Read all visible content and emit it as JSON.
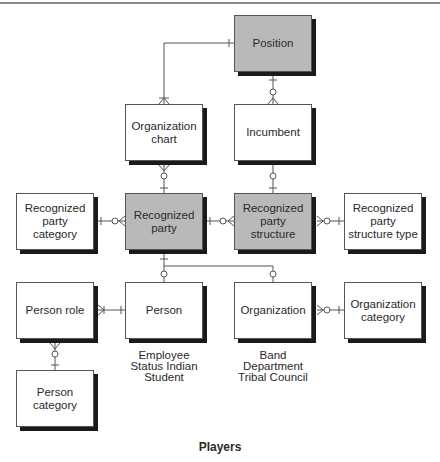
{
  "diagram": {
    "title": "Players",
    "colors": {
      "shaded_entity": "#b9b9b9",
      "plain_entity": "#ffffff",
      "shadow": "#1a1a1a",
      "line": "#555555"
    },
    "entities": {
      "position": {
        "label": "Position",
        "shaded": true
      },
      "organization_chart": {
        "label": "Organization chart",
        "shaded": false
      },
      "incumbent": {
        "label": "Incumbent",
        "shaded": false
      },
      "recognized_party_category": {
        "label": "Recognized party category",
        "shaded": false
      },
      "recognized_party": {
        "label": "Recognized party",
        "shaded": true
      },
      "recognized_party_structure": {
        "label": "Recognized party structure",
        "shaded": true
      },
      "recognized_party_structure_type": {
        "label": "Recognized party structure type",
        "shaded": false
      },
      "person_role": {
        "label": "Person role",
        "shaded": false
      },
      "person": {
        "label": "Person",
        "shaded": false
      },
      "organization": {
        "label": "Organization",
        "shaded": false
      },
      "organization_category": {
        "label": "Organization category",
        "shaded": false
      },
      "person_category": {
        "label": "Person category",
        "shaded": false
      }
    },
    "captions": {
      "person_examples": "Employee\nStatus Indian\nStudent",
      "organization_examples": "Band\nDepartment\nTribal Council"
    },
    "relationships": [
      {
        "from": "Position",
        "to": "Organization chart",
        "from_end": "one",
        "to_end": "many"
      },
      {
        "from": "Position",
        "to": "Incumbent",
        "from_end": "one",
        "to_end": "zero-or-many"
      },
      {
        "from": "Organization chart",
        "to": "Recognized party",
        "from_end": "zero-or-many",
        "to_end": "one"
      },
      {
        "from": "Incumbent",
        "to": "Recognized party structure",
        "from_end": "zero-or-one",
        "to_end": "one"
      },
      {
        "from": "Recognized party category",
        "to": "Recognized party",
        "from_end": "one",
        "to_end": "zero-or-many"
      },
      {
        "from": "Recognized party",
        "to": "Recognized party structure",
        "from_end": "one",
        "to_end": "zero-or-many"
      },
      {
        "from": "Recognized party structure",
        "to": "Recognized party structure type",
        "from_end": "zero-or-many",
        "to_end": "one"
      },
      {
        "from": "Recognized party",
        "to": "Person",
        "from_end": "one",
        "to_end": "zero-or-one"
      },
      {
        "from": "Recognized party",
        "to": "Organization",
        "from_end": "one",
        "to_end": "zero-or-one"
      },
      {
        "from": "Person role",
        "to": "Person",
        "from_end": "many",
        "to_end": "one"
      },
      {
        "from": "Person role",
        "to": "Person category",
        "from_end": "zero-or-many",
        "to_end": "one"
      },
      {
        "from": "Organization",
        "to": "Organization category",
        "from_end": "zero-or-many",
        "to_end": "one"
      }
    ]
  }
}
